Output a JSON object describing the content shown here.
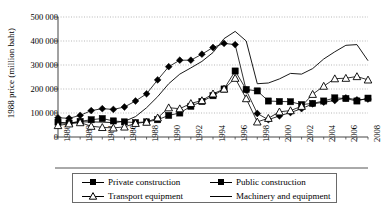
{
  "chart_data": {
    "type": "line",
    "title": "",
    "xlabel": "",
    "ylabel": "1988 price (million baht)",
    "ylim": [
      0,
      500000
    ],
    "xlim": [
      1980,
      2008
    ],
    "grid": true,
    "legend_position": "bottom",
    "ytick_labels": [
      "0",
      "100 000",
      "200 000",
      "300 000",
      "400 000",
      "500 000"
    ],
    "ytick_values": [
      0,
      100000,
      200000,
      300000,
      400000,
      500000
    ],
    "xtick_labels": [
      "1980",
      "1982",
      "1984",
      "1986",
      "1988",
      "1990",
      "1992",
      "1994",
      "1996",
      "1998",
      "2000",
      "2002",
      "2004",
      "2006",
      "2008"
    ],
    "x": [
      1980,
      1981,
      1982,
      1983,
      1984,
      1985,
      1986,
      1987,
      1988,
      1989,
      1990,
      1991,
      1992,
      1993,
      1994,
      1995,
      1996,
      1997,
      1998,
      1999,
      2000,
      2001,
      2002,
      2003,
      2004,
      2005,
      2006,
      2007,
      2008
    ],
    "series": [
      {
        "name": "Private construction",
        "marker": "diamond-filled",
        "color": "#000000",
        "values": [
          80000,
          78000,
          90000,
          110000,
          118000,
          115000,
          125000,
          150000,
          180000,
          238000,
          293000,
          320000,
          320000,
          345000,
          373000,
          390000,
          385000,
          195000,
          98000,
          72000,
          88000,
          102000,
          118000,
          138000,
          145000,
          152000,
          163000,
          155000,
          158000
        ]
      },
      {
        "name": "Public construction",
        "marker": "square-filled",
        "color": "#000000",
        "values": [
          62000,
          58000,
          65000,
          72000,
          77000,
          67000,
          63000,
          60000,
          63000,
          72000,
          90000,
          100000,
          128000,
          148000,
          172000,
          200000,
          275000,
          198000,
          192000,
          150000,
          148000,
          147000,
          135000,
          140000,
          150000,
          163000,
          160000,
          150000,
          162000
        ]
      },
      {
        "name": "Transport equipment",
        "marker": "triangle-open",
        "color": "#000000",
        "values": [
          48000,
          55000,
          60000,
          45000,
          40000,
          38000,
          42000,
          57000,
          62000,
          80000,
          122000,
          118000,
          140000,
          152000,
          180000,
          200000,
          245000,
          160000,
          63000,
          78000,
          105000,
          110000,
          128000,
          178000,
          212000,
          243000,
          245000,
          252000,
          238000
        ]
      },
      {
        "name": "Machinery and equipment",
        "marker": "none",
        "color": "#000000",
        "values": [
          58000,
          58000,
          63000,
          63000,
          62000,
          60000,
          65000,
          85000,
          122000,
          168000,
          222000,
          262000,
          288000,
          315000,
          352000,
          410000,
          440000,
          400000,
          222000,
          225000,
          242000,
          265000,
          262000,
          285000,
          325000,
          355000,
          382000,
          385000,
          318000
        ]
      }
    ]
  },
  "legend": {
    "items": [
      {
        "label": "Private construction",
        "marker": "diamond-filled"
      },
      {
        "label": "Public construction",
        "marker": "square-filled"
      },
      {
        "label": "Transport equipment",
        "marker": "triangle-open"
      },
      {
        "label": "Machinery and equipment",
        "marker": "none"
      }
    ]
  }
}
